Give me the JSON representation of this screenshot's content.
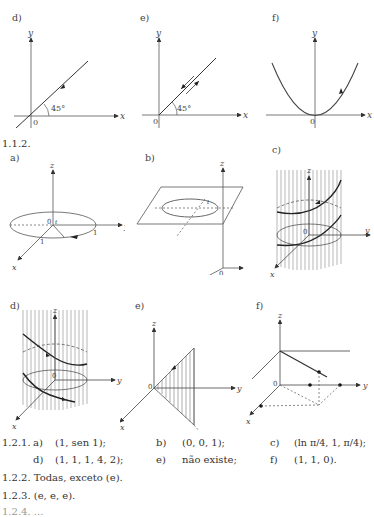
{
  "section_1_1_1": {
    "figures": [
      {
        "label": "d)",
        "description": "Line through origin at 45 degrees with arrow",
        "angle": "45°",
        "axes": {
          "x": "x",
          "y": "y",
          "origin": "0"
        }
      },
      {
        "label": "e)",
        "description": "Line through origin at 45 degrees traversed both directions",
        "angle": "45°",
        "axes": {
          "x": "x",
          "y": "y",
          "origin": "0"
        }
      },
      {
        "label": "f)",
        "description": "Parabola with vertex at origin",
        "axes": {
          "x": "x",
          "y": "y",
          "origin": "0"
        }
      }
    ]
  },
  "section_1_1_2": {
    "heading": "1.1.2.",
    "figures": [
      {
        "label": "a)",
        "description": "Unit circle in xy-plane with radius markers",
        "axes": {
          "x": "x",
          "y": "y",
          "z": "z",
          "origin": "0"
        },
        "ticks": [
          "1",
          "1",
          "1"
        ],
        "angle": "t"
      },
      {
        "label": "b)",
        "description": "Circle on horizontal plane above xy-plane",
        "axes": {
          "x": "x",
          "y": "y",
          "z": "z",
          "origin": "0"
        },
        "angle": "t"
      },
      {
        "label": "c)",
        "description": "Helix on cylinder",
        "axes": {
          "x": "x",
          "y": "y",
          "z": "z",
          "origin": "0"
        },
        "angle": "t"
      },
      {
        "label": "d)",
        "description": "Curve on cylinder",
        "axes": {
          "x": "x",
          "y": "y",
          "z": "z",
          "origin": "0"
        }
      },
      {
        "label": "e)",
        "description": "Shaded triangle in plane from origin",
        "axes": {
          "x": "x",
          "y": "y",
          "z": "z",
          "origin": "0"
        }
      },
      {
        "label": "f)",
        "description": "Line segments with points",
        "axes": {
          "x": "x",
          "y": "y",
          "z": "z",
          "origin": "0"
        }
      }
    ]
  },
  "answers": {
    "q1_2_1": {
      "number": "1.2.1.",
      "items": [
        {
          "label": "a)",
          "value": "(1, sen 1);"
        },
        {
          "label": "b)",
          "value": "(0, 0, 1);"
        },
        {
          "label": "c)",
          "value": "(ln π/4, 1, π/4);"
        },
        {
          "label": "d)",
          "value": "(1, 1, 1, 4, 2);"
        },
        {
          "label": "e)",
          "value": "não existe;"
        },
        {
          "label": "f)",
          "value": "(1, 1, 0)."
        }
      ]
    },
    "q1_2_2": {
      "text": "1.2.2. Todas, exceto (e)."
    },
    "q1_2_3": {
      "text": "1.2.3. (e, e, e)."
    },
    "q1_2_4": {
      "text": "1.2.4. ..."
    }
  }
}
